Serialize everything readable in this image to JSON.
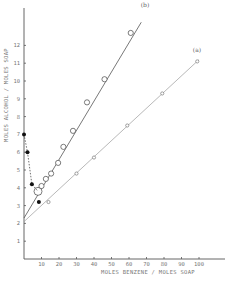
{
  "chart_data": {
    "type": "scatter",
    "title": "",
    "xlabel": "MOLES BENZENE / MOLES SOAP",
    "ylabel": "MOLES ALCOHOL / MOLES SOAP",
    "xlim": [
      0,
      110
    ],
    "ylim": [
      0,
      13
    ],
    "xticks": [
      10,
      20,
      30,
      40,
      50,
      60,
      70,
      80,
      90,
      100
    ],
    "yticks": [
      1,
      2,
      3,
      4,
      5,
      6,
      7,
      8,
      9,
      10,
      11,
      12
    ],
    "grid": false,
    "legend": "none",
    "series": [
      {
        "name": "(a)",
        "marker": "small-open-circle",
        "line": "solid-fit",
        "fit": {
          "x0": 0,
          "y0": 2.1,
          "x1": 100,
          "y1": 11.2
        },
        "points": [
          {
            "x": 14,
            "y": 3.2
          },
          {
            "x": 30,
            "y": 4.8
          },
          {
            "x": 40,
            "y": 5.7
          },
          {
            "x": 59,
            "y": 7.5
          },
          {
            "x": 79,
            "y": 9.3
          },
          {
            "x": 99,
            "y": 11.1
          }
        ]
      },
      {
        "name": "(b)",
        "marker": "large-open-circle",
        "line": "solid-fit",
        "fit": {
          "x0": 0,
          "y0": 2.3,
          "x1": 67,
          "y1": 13.3
        },
        "points": [
          {
            "x": 8,
            "y": 3.8
          },
          {
            "x": 10,
            "y": 4.1
          },
          {
            "x": 12.5,
            "y": 4.5
          },
          {
            "x": 15.5,
            "y": 4.8
          },
          {
            "x": 19.5,
            "y": 5.4
          },
          {
            "x": 22.5,
            "y": 6.3
          },
          {
            "x": 28,
            "y": 7.2
          },
          {
            "x": 36,
            "y": 8.8
          },
          {
            "x": 46,
            "y": 10.1
          },
          {
            "x": 61,
            "y": 12.7
          }
        ]
      },
      {
        "name": "filled",
        "marker": "filled-circle",
        "line": "dashed",
        "points": [
          {
            "x": 0,
            "y": 7.0
          },
          {
            "x": 2,
            "y": 6.0
          },
          {
            "x": 4.5,
            "y": 4.2
          },
          {
            "x": 8.5,
            "y": 3.2
          }
        ],
        "dashed_path": [
          {
            "x": 0,
            "y": 7.0
          },
          {
            "x": 2,
            "y": 6.0
          },
          {
            "x": 4.5,
            "y": 4.2
          },
          {
            "x": 8,
            "y": 3.8
          }
        ]
      }
    ],
    "annotations": [
      {
        "text": "(a)",
        "near": "end of line a"
      },
      {
        "text": "(b)",
        "near": "end of line b"
      }
    ]
  }
}
